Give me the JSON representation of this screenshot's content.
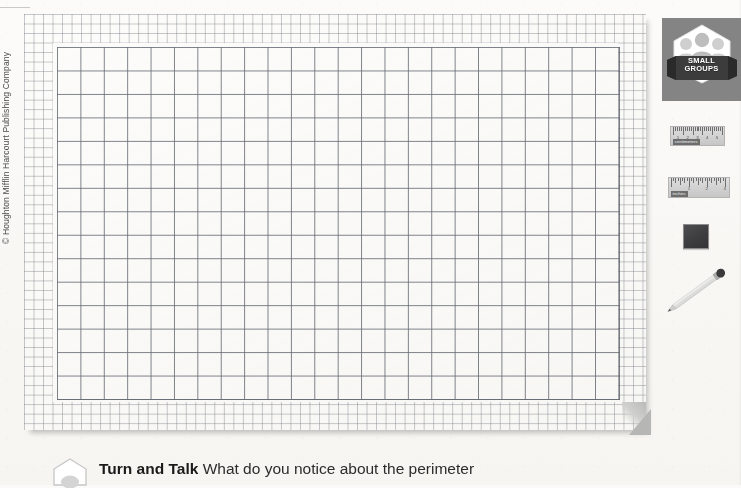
{
  "page": {
    "background_color": "#f8f7f4",
    "copyright": "© Houghton Mifflin Harcourt Publishing Company"
  },
  "grid_sheet": {
    "name": "grid-paper",
    "border_band_label": "unit squares border",
    "fine_cell_px": 9.52,
    "main_cell_px": 23.4,
    "main_columns": 24,
    "main_rows": 15,
    "line_color": "#696e78",
    "paper_color": "#ffffff"
  },
  "sidebar": {
    "small_groups": {
      "line1": "SMALL",
      "line2": "GROUPS",
      "panel_color": "#848484",
      "badge_color": "#ffffff",
      "ribbon_color": "#3c3c3c"
    },
    "manipulatives": [
      {
        "name": "centimeter-ruler",
        "label": "centimeters",
        "units": [
          "1",
          "2",
          "3",
          "4",
          "5"
        ],
        "tick_count": 26
      },
      {
        "name": "inch-ruler",
        "label": "inches",
        "units": [
          "1",
          "2",
          "3"
        ],
        "tick_count": 25
      },
      {
        "name": "color-tile",
        "label": "color tile",
        "color": "#3d3d3f"
      },
      {
        "name": "pencil",
        "label": "pencil",
        "color": "#d8d8d6"
      }
    ]
  },
  "turn_and_talk": {
    "label": "Turn and Talk",
    "prompt": "What do you notice about the perimeter"
  }
}
